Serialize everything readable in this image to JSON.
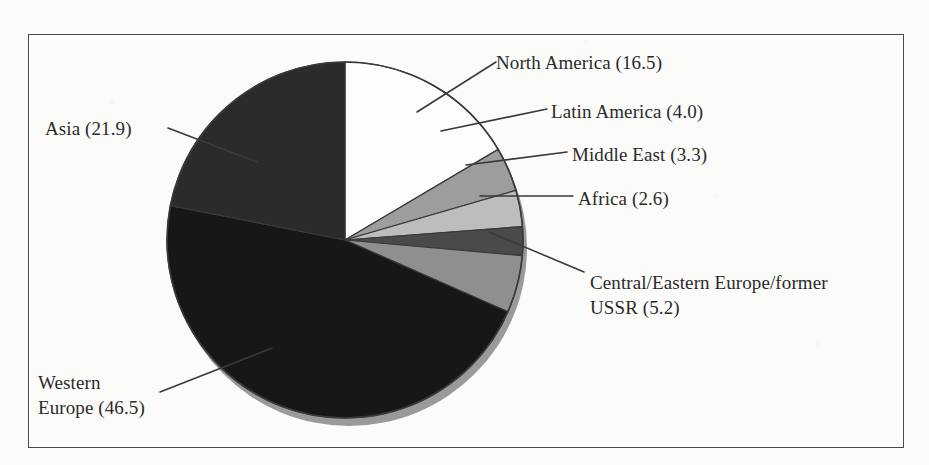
{
  "figure": {
    "frame_border_color": "#4a4a4a",
    "background_color": "#fbfbfa",
    "label_color": "#2b2b2b",
    "leader_line_color": "#3a3a3a"
  },
  "chart_data": {
    "type": "pie",
    "title": "",
    "xlabel": "",
    "ylabel": "",
    "legend_position": "callout-labels",
    "grid": false,
    "units": "percent",
    "total": 100.0,
    "start_angle_deg": 0,
    "direction": "clockwise",
    "categories": [
      "North America",
      "Latin America",
      "Middle East",
      "Africa",
      "Central/Eastern Europe/former USSR",
      "Western Europe",
      "Asia"
    ],
    "values": [
      16.5,
      4.0,
      3.3,
      2.6,
      5.2,
      46.5,
      21.9
    ],
    "slices": [
      {
        "name": "North America",
        "value": 16.5,
        "label": "North America (16.5)",
        "label_lines": [
          "North America (16.5)"
        ],
        "color": "#fdfdfc",
        "start_angle": 0,
        "end_angle": 59.4
      },
      {
        "name": "Latin America",
        "value": 4.0,
        "label": "Latin America (4.0)",
        "label_lines": [
          "Latin America (4.0)"
        ],
        "color": "#9d9d9d",
        "start_angle": 59.4,
        "end_angle": 73.8
      },
      {
        "name": "Middle East",
        "value": 3.3,
        "label": "Middle East (3.3)",
        "label_lines": [
          "Middle East (3.3)"
        ],
        "color": "#bdbdbd",
        "start_angle": 73.8,
        "end_angle": 85.68
      },
      {
        "name": "Africa",
        "value": 2.6,
        "label": "Africa (2.6)",
        "label_lines": [
          "Africa (2.6)"
        ],
        "color": "#4a4a4a",
        "start_angle": 85.68,
        "end_angle": 95.04
      },
      {
        "name": "Central/Eastern Europe/former USSR",
        "value": 5.2,
        "label": "Central/Eastern Europe/former USSR (5.2)",
        "label_lines": [
          "Central/Eastern Europe/former",
          "USSR (5.2)"
        ],
        "color": "#8f8f8f",
        "start_angle": 95.04,
        "end_angle": 113.76
      },
      {
        "name": "Western Europe",
        "value": 46.5,
        "label": "Western Europe (46.5)",
        "label_lines": [
          "Western",
          "Europe (46.5)"
        ],
        "color": "#171717",
        "start_angle": 113.76,
        "end_angle": 281.16
      },
      {
        "name": "Asia",
        "value": 21.9,
        "label": "Asia (21.9)",
        "label_lines": [
          "Asia (21.9)"
        ],
        "color": "#2b2b2b",
        "start_angle": 281.16,
        "end_angle": 360
      }
    ]
  },
  "labels": {
    "north_america": "North America (16.5)",
    "latin_america": "Latin America (4.0)",
    "middle_east": "Middle East (3.3)",
    "africa": "Africa (2.6)",
    "cee_line1": "Central/Eastern Europe/former",
    "cee_line2": "USSR (5.2)",
    "asia": "Asia (21.9)",
    "western_europe_line1": "Western",
    "western_europe_line2": "Europe (46.5)"
  }
}
